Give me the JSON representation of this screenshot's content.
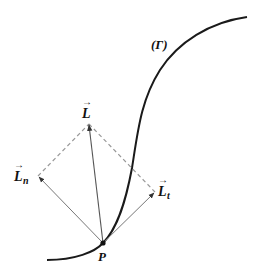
{
  "figure": {
    "curve_label": "(Γ)",
    "point_label": "P",
    "vectors": {
      "L": {
        "symbol": "L",
        "subscript": "",
        "arrow": "→",
        "description": "resultant vector"
      },
      "Ln": {
        "symbol": "L",
        "subscript": "n",
        "arrow": "→",
        "description": "normal component"
      },
      "Lt": {
        "symbol": "L",
        "subscript": "t",
        "arrow": "→",
        "description": "tangential component"
      }
    },
    "colors": {
      "curve": "#1a1a1a",
      "vector": "#777777",
      "dashed": "#999999",
      "point": "#111111",
      "text": "#111111"
    }
  }
}
